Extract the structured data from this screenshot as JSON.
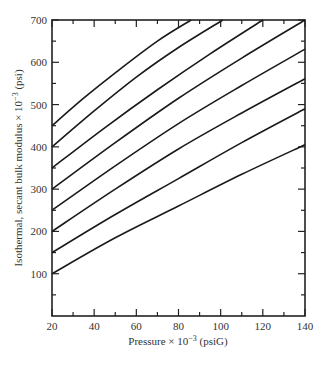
{
  "chart_data": {
    "type": "line",
    "title": "",
    "xlabel": "Pressure × 10⁻³ (psiG)",
    "ylabel": "Isothermal, secant bulk modulus × 10⁻³ (psi)",
    "xlim": [
      20,
      140
    ],
    "ylim": [
      0,
      700
    ],
    "x_ticks": [
      20,
      40,
      60,
      80,
      100,
      120,
      140
    ],
    "x_tick_labels": [
      "20",
      "40",
      "60",
      "80",
      "100",
      "120",
      "140"
    ],
    "y_ticks": [
      100,
      200,
      300,
      400,
      500,
      600,
      700
    ],
    "y_tick_labels": [
      "100",
      "200",
      "300",
      "400",
      "500",
      "600",
      "700"
    ],
    "grid": false,
    "legend": "none",
    "series": [
      {
        "name": "curve-1",
        "x": [
          20,
          50,
          80,
          110,
          140
        ],
        "values": [
          100,
          185,
          260,
          335,
          405
        ]
      },
      {
        "name": "curve-2",
        "x": [
          20,
          50,
          80,
          110,
          140
        ],
        "values": [
          150,
          240,
          325,
          410,
          490
        ]
      },
      {
        "name": "curve-3",
        "x": [
          20,
          50,
          80,
          110,
          140
        ],
        "values": [
          200,
          300,
          395,
          480,
          561
        ]
      },
      {
        "name": "curve-4",
        "x": [
          20,
          50,
          80,
          110,
          140
        ],
        "values": [
          250,
          355,
          455,
          545,
          631
        ]
      },
      {
        "name": "curve-5",
        "x": [
          20,
          50,
          80,
          110,
          140
        ],
        "values": [
          300,
          410,
          515,
          610,
          700
        ]
      },
      {
        "name": "curve-6",
        "x": [
          20,
          45,
          70,
          95,
          120
        ],
        "values": [
          350,
          445,
          535,
          620,
          700
        ]
      },
      {
        "name": "curve-7",
        "x": [
          20,
          40,
          60,
          80,
          101
        ],
        "values": [
          400,
          485,
          565,
          635,
          700
        ]
      },
      {
        "name": "curve-8",
        "x": [
          20,
          35,
          50,
          70,
          86
        ],
        "values": [
          450,
          515,
          575,
          650,
          700
        ]
      }
    ]
  },
  "axes": {
    "xlabel": "Pressure × 10",
    "xlabel_exp": "−3",
    "xlabel_unit": " (psiG)",
    "ylabel": "Isothermal, secant bulk modulus × 10",
    "ylabel_exp": "−3",
    "ylabel_unit": " (psi)"
  }
}
